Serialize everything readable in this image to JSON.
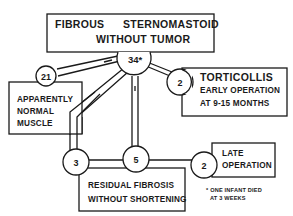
{
  "diagram": {
    "root": {
      "line1a": "FIBROUS",
      "line1b": "STERNOMASTOID",
      "line2": "WITHOUT TUMOR",
      "count": "34*"
    },
    "normal": {
      "count": "21",
      "lines": [
        "APPARENTLY",
        "NORMAL",
        "MUSCLE"
      ]
    },
    "torticollis": {
      "count": "2",
      "title": "TORTICOLLIS",
      "lines": [
        "EARLY OPERATION",
        "AT 9-15 MONTHS"
      ]
    },
    "residual": {
      "count_left": "3",
      "count_mid": "5",
      "lines": [
        "RESIDUAL FIBROSIS",
        "WITHOUT SHORTENING"
      ]
    },
    "late": {
      "count": "2",
      "lines": [
        "LATE",
        "OPERATION"
      ]
    },
    "footnote": {
      "lines": [
        "* ONE INFANT DIED",
        "AT  3 WEEKS"
      ]
    }
  }
}
